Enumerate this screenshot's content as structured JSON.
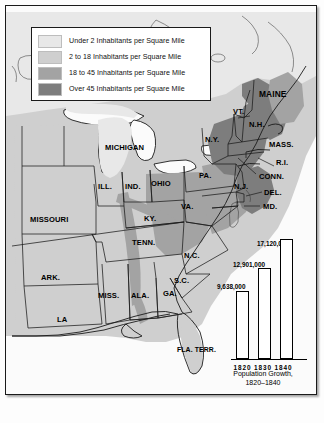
{
  "map": {
    "title": "Population Density of the Eastern United States, 1820-1840",
    "legend": {
      "items": [
        {
          "label": "Under 2 Inhabitants per Square Mile",
          "color": "#e8e8e8",
          "swatch_name": "legend-swatch-under-2"
        },
        {
          "label": "2 to 18 Inhabitants per Square Mile",
          "color": "#cfcfcf",
          "swatch_name": "legend-swatch-2-to-18"
        },
        {
          "label": "18 to 45 Inhabitants per Square Mile",
          "color": "#a3a3a3",
          "swatch_name": "legend-swatch-18-to-45"
        },
        {
          "label": "Over 45 Inhabitants per Square Mile",
          "color": "#7d7d7d",
          "swatch_name": "legend-swatch-over-45"
        }
      ]
    },
    "labels": [
      {
        "name": "label-maine",
        "text": "MAINE"
      },
      {
        "name": "label-vt",
        "text": "VT."
      },
      {
        "name": "label-nh",
        "text": "N.H."
      },
      {
        "name": "label-mass",
        "text": "MASS."
      },
      {
        "name": "label-ri",
        "text": "R.I."
      },
      {
        "name": "label-conn",
        "text": "CONN."
      },
      {
        "name": "label-ny",
        "text": "N.Y."
      },
      {
        "name": "label-nj",
        "text": "N.J."
      },
      {
        "name": "label-pa",
        "text": "PA."
      },
      {
        "name": "label-del",
        "text": "DEL."
      },
      {
        "name": "label-md",
        "text": "MD."
      },
      {
        "name": "label-michigan",
        "text": "MICHIGAN"
      },
      {
        "name": "label-ohio",
        "text": "OHIO"
      },
      {
        "name": "label-ind",
        "text": "IND."
      },
      {
        "name": "label-ill",
        "text": "ILL."
      },
      {
        "name": "label-missouri",
        "text": "MISSOURI"
      },
      {
        "name": "label-ky",
        "text": "KY."
      },
      {
        "name": "label-va",
        "text": "VA."
      },
      {
        "name": "label-tenn",
        "text": "TENN."
      },
      {
        "name": "label-nc",
        "text": "N.C."
      },
      {
        "name": "label-sc",
        "text": "S.C."
      },
      {
        "name": "label-ark",
        "text": "ARK."
      },
      {
        "name": "label-miss",
        "text": "MISS."
      },
      {
        "name": "label-ala",
        "text": "ALA."
      },
      {
        "name": "label-ga",
        "text": "GA."
      },
      {
        "name": "label-la",
        "text": "LA"
      },
      {
        "name": "label-fla-terr",
        "text": "FLA. TERR."
      }
    ]
  },
  "chart_data": {
    "type": "bar",
    "title": "Population Growth,",
    "subtitle": "1820–1840",
    "categories": [
      "1820",
      "1830",
      "1840"
    ],
    "values": [
      9638000,
      12901000,
      17120000
    ],
    "value_labels": [
      "9,638,000",
      "12,901,000",
      "17,120,000"
    ],
    "years_line": "1820 1830 1840",
    "xlabel": "",
    "ylabel": "",
    "ylim": [
      0,
      18000000
    ],
    "grid": false,
    "legend": "none",
    "bar_color": "#ffffff",
    "bar_border": "#000000"
  }
}
